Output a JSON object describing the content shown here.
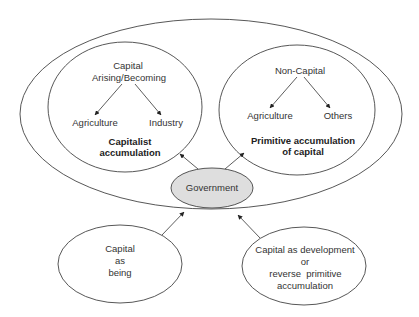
{
  "diagram": {
    "colors": {
      "stroke": "#444444",
      "government_fill": "#dedede",
      "background": "#ffffff"
    },
    "capitalist_circle": {
      "source": "Capital\nArising/Becoming",
      "source_line1": "Capital",
      "source_line2": "Arising/Becoming",
      "child_left": "Agriculture",
      "child_right": "Industry",
      "caption_line1": "Capitalist",
      "caption_line2": "accumulation"
    },
    "primitive_circle": {
      "source": "Non-Capital",
      "child_left": "Agriculture",
      "child_right": "Others",
      "caption_line1": "Primitive accumulation",
      "caption_line2": "of capital"
    },
    "government": {
      "label": "Government"
    },
    "capital_as_being": {
      "line1": "Capital",
      "line2": "as",
      "line3": "being"
    },
    "capital_as_development": {
      "line1": "Capital as development",
      "line2": "or",
      "line3": "reverse  primitive",
      "line4": "accumulation"
    }
  }
}
